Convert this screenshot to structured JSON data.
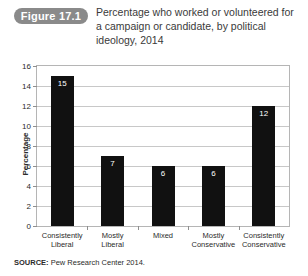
{
  "figure": {
    "badge": "Figure 17.1",
    "title": "Percentage who worked or volunteered for a campaign or candidate, by political ideology, 2014"
  },
  "source": {
    "label": "SOURCE:",
    "text": "Pew Research Center 2014."
  },
  "colors": {
    "bar": "#111111",
    "badge": "#8a8a8a",
    "gridline": "#c8c8c8",
    "plot_border": "#b5b5b5",
    "value_label": "#ffffff"
  },
  "chart_data": {
    "type": "bar",
    "title": "Percentage who worked or volunteered for a campaign or candidate, by political ideology, 2014",
    "xlabel": "",
    "ylabel": "Percentage",
    "categories": [
      "Consistently Liberal",
      "Mostly Liberal",
      "Mixed",
      "Mostly Conservative",
      "Consistently Conservative"
    ],
    "category_lines": [
      [
        "Consistently",
        "Liberal"
      ],
      [
        "Mostly",
        "Liberal"
      ],
      [
        "Mixed",
        ""
      ],
      [
        "Mostly",
        "Conservative"
      ],
      [
        "Consistently",
        "Conservative"
      ]
    ],
    "values": [
      15,
      7,
      6,
      6,
      12
    ],
    "value_labels": [
      "15",
      "7",
      "6",
      "6",
      "12"
    ],
    "ylim": [
      0,
      16
    ],
    "yticks": [
      0,
      2,
      4,
      6,
      8,
      10,
      12,
      14,
      16
    ],
    "ytick_labels": [
      "0",
      "2",
      "4",
      "6",
      "8",
      "10",
      "12",
      "14",
      "16"
    ],
    "grid": true,
    "legend": "none"
  }
}
